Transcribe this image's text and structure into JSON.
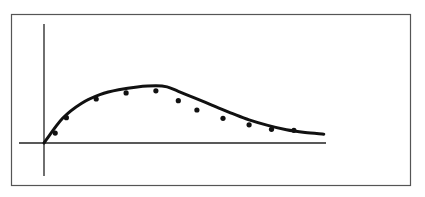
{
  "chart_data": {
    "type": "scatter",
    "title": "",
    "xlabel": "",
    "ylabel": "",
    "grid": false,
    "legend": null,
    "axis_ticks": false,
    "series": [
      {
        "name": "observed",
        "kind": "points",
        "x": [
          0.3,
          0.6,
          1.4,
          2.2,
          3.0,
          3.6,
          4.1,
          4.8,
          5.5,
          6.1,
          6.7
        ],
        "y": [
          0.18,
          0.46,
          0.8,
          0.91,
          0.95,
          0.77,
          0.6,
          0.45,
          0.33,
          0.25,
          0.23
        ]
      },
      {
        "name": "fitted curve",
        "kind": "line",
        "x": [
          0.0,
          0.5,
          1.0,
          1.5,
          2.0,
          2.5,
          3.0,
          3.3,
          3.6,
          4.0,
          4.5,
          5.0,
          5.5,
          6.0,
          6.5,
          7.0,
          7.5
        ],
        "y": [
          0.0,
          0.45,
          0.72,
          0.88,
          0.97,
          1.02,
          1.04,
          1.02,
          0.94,
          0.83,
          0.69,
          0.55,
          0.42,
          0.32,
          0.24,
          0.19,
          0.16
        ]
      }
    ],
    "xlim": [
      0,
      7.5
    ],
    "ylim": [
      -0.55,
      2.2
    ]
  },
  "colors": {
    "ink": "#111111",
    "frame": "#555555",
    "background": "#ffffff"
  }
}
